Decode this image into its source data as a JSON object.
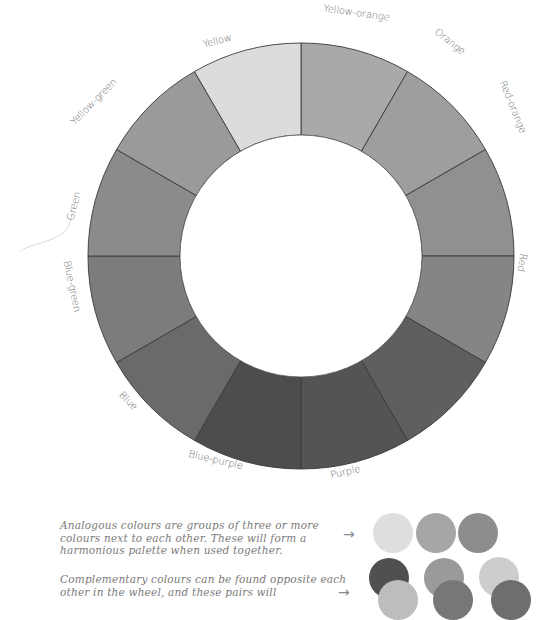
{
  "wheel": {
    "center": [
      301,
      256
    ],
    "outer_radius": 213,
    "inner_radius": 121,
    "label_radius": 226,
    "divider_color": "#3a3a3a",
    "segments": [
      {
        "name": "Yellow-orange",
        "color": "#a9a9a9"
      },
      {
        "name": "Orange",
        "color": "#9e9e9e"
      },
      {
        "name": "Red-orange",
        "color": "#909090"
      },
      {
        "name": "Red",
        "color": "#858585"
      },
      {
        "name": "Red-purple",
        "color": "#5e5e5e"
      },
      {
        "name": "Purple",
        "color": "#545454"
      },
      {
        "name": "Blue-purple",
        "color": "#4d4d4d"
      },
      {
        "name": "Blue",
        "color": "#6a6a6a"
      },
      {
        "name": "Blue-green",
        "color": "#7c7c7c"
      },
      {
        "name": "Green",
        "color": "#8b8b8b"
      },
      {
        "name": "Yellow-green",
        "color": "#9a9a9a"
      },
      {
        "name": "Yellow",
        "color": "#dcdcdc"
      }
    ],
    "labels": [
      {
        "text": "Yellow-orange",
        "x": 356,
        "y": 16,
        "rotate": 8
      },
      {
        "text": "Orange",
        "x": 448,
        "y": 44,
        "rotate": 38
      },
      {
        "text": "Red-orange",
        "x": 510,
        "y": 108,
        "rotate": 68
      },
      {
        "text": "Red",
        "x": 519,
        "y": 262,
        "rotate": 100
      },
      {
        "text": "Red-purple",
        "x": 452,
        "y": 404,
        "rotate": -45
      },
      {
        "text": "Purple",
        "x": 346,
        "y": 475,
        "rotate": -13
      },
      {
        "text": "Blue-purple",
        "x": 215,
        "y": 463,
        "rotate": 13
      },
      {
        "text": "Blue",
        "x": 126,
        "y": 403,
        "rotate": 45
      },
      {
        "text": "Blue-green",
        "x": 69,
        "y": 287,
        "rotate": 78
      },
      {
        "text": "Green",
        "x": 77,
        "y": 207,
        "rotate": -75
      },
      {
        "text": "Yellow-green",
        "x": 96,
        "y": 104,
        "rotate": -45
      },
      {
        "text": "Yellow",
        "x": 218,
        "y": 44,
        "rotate": -14
      }
    ]
  },
  "notes": {
    "analogous": "Analogous colours are groups of three or more colours next to each other. These will form a harmonious palette when used together.",
    "complementary": "Complementary colours can be found opposite each other in the wheel, and these pairs will",
    "arrow": "→"
  },
  "swatches": {
    "radius": 20,
    "analogous": [
      {
        "cx": 393,
        "cy": 533,
        "color": "#dedede"
      },
      {
        "cx": 436,
        "cy": 533,
        "color": "#a6a6a6"
      },
      {
        "cx": 478,
        "cy": 533,
        "color": "#8d8d8d"
      }
    ],
    "complementary": [
      {
        "back": {
          "cx": 389,
          "cy": 578,
          "color": "#505050"
        },
        "front": {
          "cx": 398,
          "cy": 600,
          "color": "#bdbdbd"
        }
      },
      {
        "back": {
          "cx": 444,
          "cy": 578,
          "color": "#9a9a9a"
        },
        "front": {
          "cx": 453,
          "cy": 600,
          "color": "#777777"
        }
      },
      {
        "back": {
          "cx": 499,
          "cy": 577,
          "color": "#cdcdcd"
        },
        "front": {
          "cx": 511,
          "cy": 600,
          "color": "#6e6e6e"
        }
      }
    ]
  }
}
